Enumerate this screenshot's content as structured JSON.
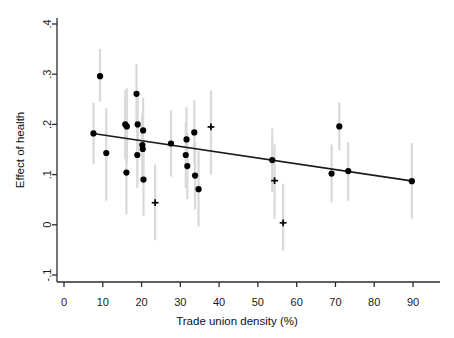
{
  "chart_data": {
    "type": "scatter",
    "title": "",
    "xlabel": "Trade union density (%)",
    "ylabel": "Effect of health",
    "xlim": [
      -3,
      96
    ],
    "ylim": [
      -0.1,
      0.4
    ],
    "grid": false,
    "legend": "none",
    "xticks": [
      0,
      10,
      20,
      30,
      40,
      50,
      60,
      70,
      80,
      90
    ],
    "xtick_labels": [
      "0",
      "10",
      "20",
      "30",
      "40",
      "50",
      "60",
      "70",
      "80",
      "90"
    ],
    "yticks": [
      -0.1,
      0,
      0.1,
      0.2,
      0.3,
      0.4
    ],
    "ytick_labels": [
      "-.1",
      "0",
      ".1",
      ".2",
      ".3",
      ".4"
    ],
    "marker_colors": {
      "point": "#000000",
      "errorbar": "#d9d9d9",
      "fitline": "#1a1a1a"
    },
    "series": [
      {
        "name": "Country estimates (filled circles)",
        "marker": "circle",
        "points": [
          {
            "x": 7.6,
            "y": 0.182,
            "lo": 0.121,
            "hi": 0.243
          },
          {
            "x": 9.3,
            "y": 0.296,
            "hi": 0.35,
            "lo": 0.245
          },
          {
            "x": 10.9,
            "y": 0.143,
            "hi": 0.232,
            "lo": 0.048
          },
          {
            "x": 15.8,
            "y": 0.2,
            "hi": 0.268,
            "lo": 0.131
          },
          {
            "x": 16.2,
            "y": 0.196,
            "hi": 0.272,
            "lo": 0.122
          },
          {
            "x": 16.1,
            "y": 0.104,
            "hi": 0.186,
            "lo": 0.021
          },
          {
            "x": 18.7,
            "y": 0.261,
            "hi": 0.32,
            "lo": 0.202
          },
          {
            "x": 19.0,
            "y": 0.2,
            "hi": 0.258,
            "lo": 0.143
          },
          {
            "x": 18.9,
            "y": 0.139,
            "hi": 0.204,
            "lo": 0.074
          },
          {
            "x": 20.4,
            "y": 0.188,
            "hi": 0.253,
            "lo": 0.122
          },
          {
            "x": 20.2,
            "y": 0.159,
            "hi": 0.222,
            "lo": 0.095
          },
          {
            "x": 20.3,
            "y": 0.151,
            "hi": 0.213,
            "lo": 0.088
          },
          {
            "x": 20.5,
            "y": 0.09,
            "hi": 0.162,
            "lo": 0.018
          },
          {
            "x": 27.6,
            "y": 0.162,
            "hi": 0.228,
            "lo": 0.096
          },
          {
            "x": 31.6,
            "y": 0.17,
            "hi": 0.234,
            "lo": 0.106
          },
          {
            "x": 31.4,
            "y": 0.139,
            "hi": 0.205,
            "lo": 0.073
          },
          {
            "x": 31.8,
            "y": 0.117,
            "hi": 0.183,
            "lo": 0.051
          },
          {
            "x": 33.6,
            "y": 0.184,
            "hi": 0.248,
            "lo": 0.12
          },
          {
            "x": 33.8,
            "y": 0.098,
            "hi": 0.165,
            "lo": 0.031
          },
          {
            "x": 34.7,
            "y": 0.071,
            "hi": 0.147,
            "lo": -0.003
          },
          {
            "x": 53.7,
            "y": 0.129,
            "hi": 0.192,
            "lo": 0.065
          },
          {
            "x": 69.0,
            "y": 0.102,
            "hi": 0.16,
            "lo": 0.045
          },
          {
            "x": 71.0,
            "y": 0.196,
            "hi": 0.244,
            "lo": 0.148
          },
          {
            "x": 73.3,
            "y": 0.107,
            "hi": 0.165,
            "lo": 0.048
          },
          {
            "x": 89.7,
            "y": 0.087,
            "hi": 0.163,
            "lo": 0.012
          }
        ]
      },
      {
        "name": "Non-significant estimates (plus markers)",
        "marker": "plus",
        "points": [
          {
            "x": 23.5,
            "y": 0.044,
            "hi": 0.12,
            "lo": -0.031
          },
          {
            "x": 37.9,
            "y": 0.195,
            "hi": 0.268,
            "lo": 0.1
          },
          {
            "x": 54.3,
            "y": 0.088,
            "hi": 0.16,
            "lo": 0.012
          },
          {
            "x": 56.5,
            "y": 0.004,
            "hi": 0.082,
            "lo": -0.051
          }
        ]
      }
    ],
    "fit_line": {
      "name": "Meta-regression fitted line",
      "x0": 7.5,
      "y0": 0.182,
      "x1": 90.0,
      "y1": 0.087
    }
  }
}
